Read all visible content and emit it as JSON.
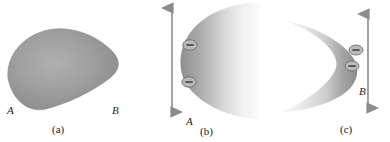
{
  "figure": {
    "background_color": "#ffffff",
    "body_fill_light": "#f2f2f2",
    "body_fill_mid": "#9a9a9a",
    "body_fill_dark": "#7d7d7d",
    "ink_color": "#1a1a1a",
    "arrow_color": "#8c8c8c",
    "charge_fill": "#b4b4b4",
    "charge_stroke": "#6e6e6e"
  },
  "panels": [
    {
      "id": "a",
      "caption": "(a)",
      "shape": "teardrop-blob",
      "labels": [
        {
          "name": "point-a",
          "text": "A"
        },
        {
          "name": "point-b",
          "text": "B"
        }
      ],
      "charges": [],
      "arrows": []
    },
    {
      "id": "b",
      "caption": "(b)",
      "shape": "crescent-open-right",
      "labels": [
        {
          "name": "point-a",
          "text": "A"
        }
      ],
      "charges": [
        {
          "name": "negative-charge",
          "symbol": "−"
        },
        {
          "name": "negative-charge",
          "symbol": "−"
        }
      ],
      "arrows": [
        {
          "name": "stretch-arrow",
          "direction": "vertical-double"
        }
      ]
    },
    {
      "id": "c",
      "caption": "(c)",
      "shape": "crescent-open-left",
      "labels": [
        {
          "name": "point-b",
          "text": "B"
        }
      ],
      "charges": [
        {
          "name": "negative-charge",
          "symbol": "−"
        },
        {
          "name": "negative-charge",
          "symbol": "−"
        }
      ],
      "arrows": [
        {
          "name": "stretch-arrow",
          "direction": "vertical-double"
        }
      ]
    }
  ]
}
